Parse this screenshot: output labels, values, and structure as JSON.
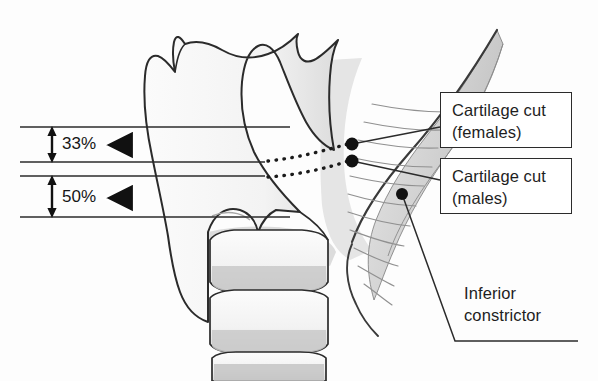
{
  "figure": {
    "type": "anatomical-diagram",
    "background_color": "#fdfdfd",
    "ink_color": "#2b2b2b"
  },
  "measurements": [
    {
      "id": "females",
      "label": "33%",
      "arrow_icon": "triangle-left-icon",
      "top_line_y": 127,
      "bottom_line_y": 162
    },
    {
      "id": "males",
      "label": "50%",
      "arrow_icon": "triangle-left-icon",
      "top_line_y": 176,
      "bottom_line_y": 217
    }
  ],
  "callouts": [
    {
      "id": "cartilage-cut-females",
      "line1": "Cartilage cut",
      "line2": "(females)",
      "box": {
        "x": 440,
        "y": 92,
        "w": 132,
        "h": 56
      }
    },
    {
      "id": "cartilage-cut-males",
      "line1": "Cartilage cut",
      "line2": "(males)",
      "box": {
        "x": 440,
        "y": 158,
        "w": 132,
        "h": 56
      }
    }
  ],
  "plain_labels": [
    {
      "id": "inferior-constrictor",
      "line1": "Inferior",
      "line2": "constrictor",
      "x": 464,
      "y": 283
    }
  ],
  "markers": [
    {
      "id": "cut-point-females",
      "x": 352,
      "y": 144,
      "r": 6.5
    },
    {
      "id": "cut-point-males",
      "x": 352,
      "y": 161,
      "r": 6.5
    },
    {
      "id": "inferior-constrictor-point",
      "x": 402,
      "y": 194,
      "r": 6.0
    }
  ],
  "colors": {
    "ink": "#2b2b2b",
    "outline": "#3a3a3a",
    "muscle_fill": "#d4d4d4",
    "cartilage_fill": "#f4f4f4",
    "shadow_fill": "#c9c9c9",
    "box_border": "#2b2b2b",
    "text": "#1e1e1e"
  }
}
